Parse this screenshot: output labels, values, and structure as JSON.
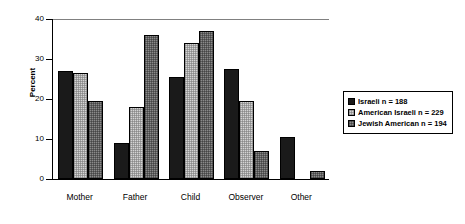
{
  "chart_data": {
    "type": "bar",
    "title": "",
    "xlabel": "",
    "ylabel": "Percent",
    "ylim": [
      0,
      40
    ],
    "yticks": [
      0,
      10,
      20,
      30,
      40
    ],
    "ytick_labels": [
      "0",
      "10",
      "20",
      "30",
      "40"
    ],
    "grid": false,
    "legend_position": "right",
    "categories": [
      "Mother",
      "Father",
      "Child",
      "Observer",
      "Other"
    ],
    "series": [
      {
        "name": "Israeli n = 188",
        "color": "#1a1a1a",
        "values": [
          27,
          9,
          25.5,
          27.5,
          10.5
        ]
      },
      {
        "name": "American Israeli n = 229",
        "color": "#d4d4d4",
        "values": [
          26.5,
          18,
          34,
          19.5,
          0
        ]
      },
      {
        "name": "Jewish American n = 194",
        "color": "#8a8a8a",
        "values": [
          19.5,
          36,
          37,
          7,
          2
        ]
      }
    ]
  },
  "axis": {
    "y_title": "Percent"
  },
  "legend": {
    "items": [
      {
        "label": "Israeli n = 188"
      },
      {
        "label": "American Israeli n = 229"
      },
      {
        "label": "Jewish American n = 194"
      }
    ]
  }
}
